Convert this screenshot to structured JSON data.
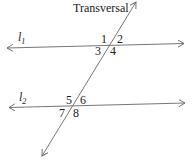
{
  "diagram": {
    "title": "Transversal",
    "lines": [
      {
        "name": "l",
        "subscript": "1",
        "role": "parallel line"
      },
      {
        "name": "l",
        "subscript": "2",
        "role": "parallel line"
      },
      {
        "name": "Transversal",
        "role": "transversal"
      }
    ],
    "angles": [
      "1",
      "2",
      "3",
      "4",
      "5",
      "6",
      "7",
      "8"
    ],
    "colors": {
      "line": "#666666",
      "text": "#222222"
    }
  }
}
